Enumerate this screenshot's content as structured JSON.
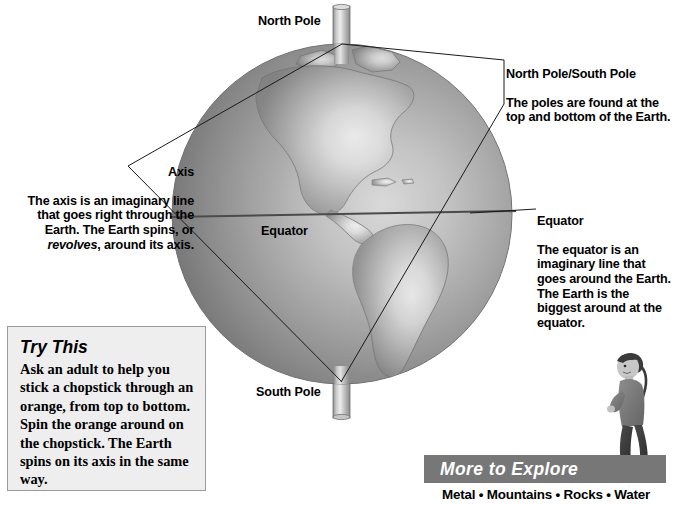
{
  "page": {
    "background": "#ffffff",
    "width": 675,
    "height": 505
  },
  "globe": {
    "name": "earth-globe",
    "center_x": 342,
    "center_y": 214,
    "radius": 170,
    "labels": {
      "north_pole": "North Pole",
      "south_pole": "South Pole",
      "equator": "Equator"
    },
    "axis_rod_color": "#b4b4b4",
    "ocean_color": "#8e8e8e",
    "land_color": "#d8d8d8"
  },
  "annotations": {
    "axis": {
      "heading": "Axis",
      "body_before": "The axis is an imaginary line that goes right through the Earth. The Earth spins, or ",
      "body_italic": "revolves",
      "body_after": ", around its axis."
    },
    "poles": {
      "heading": "North Pole/South Pole",
      "body": "The poles are found at the top and bottom of the Earth."
    },
    "equator": {
      "heading": "Equator",
      "body": "The equator is an imaginary line that goes around the Earth. The Earth is the biggest around at the equator."
    }
  },
  "try_this": {
    "title": "Try This",
    "body": "Ask an adult to help you stick a chopstick through an orange, from top to bottom. Spin the orange around on the chopstick. The Earth spins on its axis in the same way.",
    "background": "#eeeeee",
    "border_color": "#9a9a9a"
  },
  "more_to_explore": {
    "title": "More to Explore",
    "topics_line": "Metal • Mountains • Rocks • Water",
    "topics": [
      "Metal",
      "Mountains",
      "Rocks",
      "Water"
    ],
    "bar_color": "#777777",
    "title_color": "#ffffff"
  },
  "child_photo": {
    "alt": "child standing"
  }
}
